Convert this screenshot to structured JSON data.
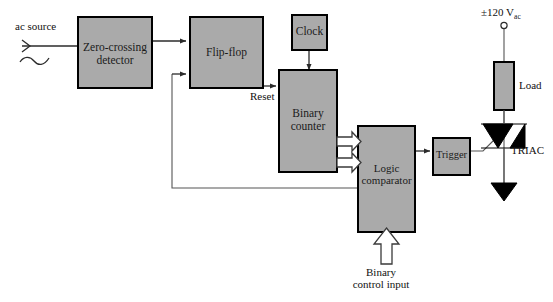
{
  "diagram": {
    "colors": {
      "block_fill": "#aaaaaa",
      "block_stroke": "#000000",
      "wire": "#2b2b2b",
      "background": "#ffffff",
      "triac_fill": "#000000"
    }
  },
  "blocks": {
    "zero_crossing_detector": {
      "line1": "Zero-crossing",
      "line2": "detector"
    },
    "flip_flop": {
      "line1": "Flip-flop",
      "line2": ""
    },
    "clock": {
      "line1": "Clock",
      "line2": ""
    },
    "binary_counter": {
      "line1": "Binary",
      "line2": "counter"
    },
    "logic_comparator": {
      "line1": "Logic",
      "line2": "comparator"
    },
    "trigger": {
      "line1": "Trigger",
      "line2": ""
    },
    "load": {
      "line1": "Load",
      "line2": ""
    }
  },
  "labels": {
    "ac_source": "ac source",
    "reset": "Reset",
    "binary_control_input_line1": "Binary",
    "binary_control_input_line2": "control input",
    "triac": "TRIAC",
    "supply_value": "±120 V",
    "supply_subscript": "ac"
  },
  "icons": {
    "sine_wave": "sine-wave-icon",
    "supply_terminal": "terminal-circle-icon",
    "ground_arrow": "arrow-terminal-icon",
    "triac_symbol": "triac-symbol-icon",
    "bus_arrow": "bus-arrow-icon"
  }
}
